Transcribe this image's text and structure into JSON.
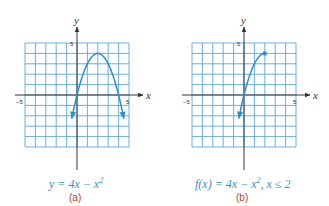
{
  "chart_data": [
    {
      "type": "line",
      "panel": "(a)",
      "title": "y = 4x − x²",
      "equation": "y = 4x - x^2",
      "xlabel": "x",
      "ylabel": "y",
      "xlim": [
        -5,
        5
      ],
      "ylim": [
        -5,
        5
      ],
      "x_tick_labels": [
        "-5",
        "5"
      ],
      "y_tick_labels": [
        "5"
      ],
      "grid": true,
      "x": [
        -0.5,
        0,
        1,
        2,
        3,
        4,
        4.5
      ],
      "y": [
        -2.25,
        0,
        3,
        4,
        3,
        0,
        -2.25
      ],
      "endpoints": "arrows both ends"
    },
    {
      "type": "line",
      "panel": "(b)",
      "title": "f(x) = 4x − x², x ≤ 2",
      "equation": "f(x) = 4x - x^2, x <= 2",
      "xlabel": "x",
      "ylabel": "y",
      "xlim": [
        -5,
        5
      ],
      "ylim": [
        -5,
        5
      ],
      "x_tick_labels": [
        "-5",
        "5"
      ],
      "y_tick_labels": [
        "5"
      ],
      "grid": true,
      "x": [
        -0.5,
        0,
        1,
        2
      ],
      "y": [
        -2.25,
        0,
        3,
        4
      ],
      "endpoints": "arrow at left end, closed dot at (2, 4)"
    }
  ],
  "panels": [
    {
      "caption": "y = 4x − x",
      "caption_sup": "2",
      "sublabel": "(a)",
      "axis_x": "x",
      "axis_y": "y",
      "tick_neg": "−5",
      "tick_pos": "5",
      "tick_y": "5"
    },
    {
      "caption": "f(x) = 4x − x",
      "caption_sup": "2",
      "caption_tail": ", x ≤ 2",
      "sublabel": "(b)",
      "axis_x": "x",
      "axis_y": "y",
      "tick_neg": "−5",
      "tick_pos": "5",
      "tick_y": "5"
    }
  ],
  "colors": {
    "grid": "#5aa8d8",
    "curve": "#2f8ccc",
    "axis": "#333333",
    "caption": "#3a8fc8",
    "sublabel": "#c0392b"
  }
}
